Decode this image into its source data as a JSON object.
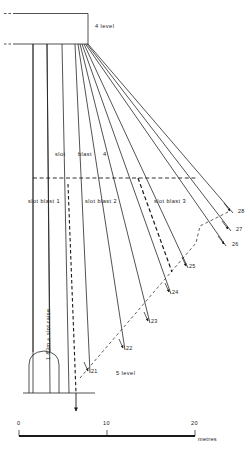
{
  "figure": {
    "title_upper": "4 level",
    "title_lower": "5 level",
    "raise_label": "1.83m ⌀ slot raise"
  },
  "blast_labels": {
    "b4_a": "slot",
    "b4_b": "blast",
    "b4_c": "4",
    "b1": "slot blast 1",
    "b2": "slot blast 2",
    "b3": "slot blast 3"
  },
  "ring_numbers": [
    {
      "id": "21",
      "x": 88,
      "y": 371
    },
    {
      "id": "22",
      "x": 123,
      "y": 348
    },
    {
      "id": "23",
      "x": 148,
      "y": 321
    },
    {
      "id": "24",
      "x": 169,
      "y": 292
    },
    {
      "id": "25",
      "x": 186,
      "y": 266
    },
    {
      "id": "26",
      "x": 229,
      "y": 244
    },
    {
      "id": "27",
      "x": 233,
      "y": 229
    },
    {
      "id": "28",
      "x": 235,
      "y": 211
    }
  ],
  "scale": {
    "tick_0": "0",
    "tick_10": "10",
    "tick_20": "20",
    "unit": "metres"
  },
  "chart_data": {
    "type": "diagram",
    "levels": [
      "4 level",
      "5 level"
    ],
    "slot_blasts": [
      "slot blast 1",
      "slot blast 2",
      "slot blast 3",
      "slot blast 4"
    ],
    "ring_ids": [
      21,
      22,
      23,
      24,
      25,
      26,
      27,
      28
    ],
    "raise_diameter_m": 1.83,
    "scale_ticks_m": [
      0,
      10,
      20
    ],
    "scale_unit": "metres"
  },
  "colors": {
    "line": "#1a1a1a",
    "background": "#ffffff"
  }
}
